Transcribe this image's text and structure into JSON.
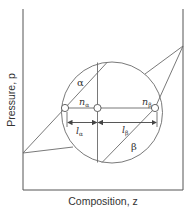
{
  "figure": {
    "xlabel": "Composition, z",
    "ylabel": "Pressure, p",
    "phase_labels": {
      "alpha": "α",
      "beta": "β"
    },
    "amount_labels": {
      "n_alpha_base": "n",
      "n_alpha_sub": "α",
      "n_beta_base": "n",
      "n_beta_sub": "β"
    },
    "length_labels": {
      "l_alpha_base": "l",
      "l_alpha_sub": "α",
      "l_beta_base": "l",
      "l_beta_sub": "β"
    },
    "colors": {
      "line": "#6a6a6a",
      "axis": "#555555",
      "text": "#333333"
    }
  }
}
